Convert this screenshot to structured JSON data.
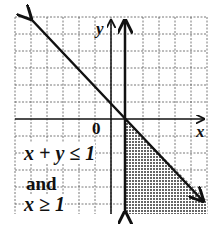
{
  "graph": {
    "x_axis_label": "x",
    "y_axis_label": "y",
    "origin_label": "0",
    "tick_label_1": "1",
    "inequality_1": "x + y ≤ 1",
    "conjunction": "and",
    "inequality_2": "x ≥ 1",
    "grid_spacing_px": 16,
    "colors": {
      "line": "#111111",
      "grid": "#555555",
      "shade": "#777777",
      "background": "#ffffff"
    }
  }
}
